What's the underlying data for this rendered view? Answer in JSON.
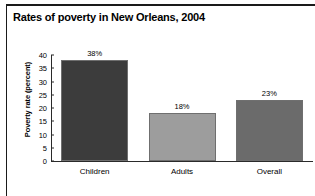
{
  "figure": {
    "title": "Rates of poverty in New Orleans, 2004",
    "footnote": ""
  },
  "chart_data": {
    "type": "bar",
    "title": "Rates of poverty in New Orleans, 2004",
    "xlabel": "",
    "ylabel": "Poverty rate (percent)",
    "categories": [
      "Children",
      "Adults",
      "Overall"
    ],
    "values": [
      38,
      18,
      23
    ],
    "value_labels": [
      "38%",
      "18%",
      "23%"
    ],
    "bar_colors": [
      "#3c3c3c",
      "#9d9d9d",
      "#6b6b6b"
    ],
    "bar_edge_color": "#6f6f6f",
    "ylim": [
      0,
      40
    ],
    "yticks": [
      0,
      5,
      10,
      15,
      20,
      25,
      30,
      35,
      40
    ],
    "ytick_labels": [
      "0",
      "5",
      "10",
      "15",
      "20",
      "25",
      "30",
      "35",
      "40"
    ],
    "grid": false,
    "legend": false
  }
}
